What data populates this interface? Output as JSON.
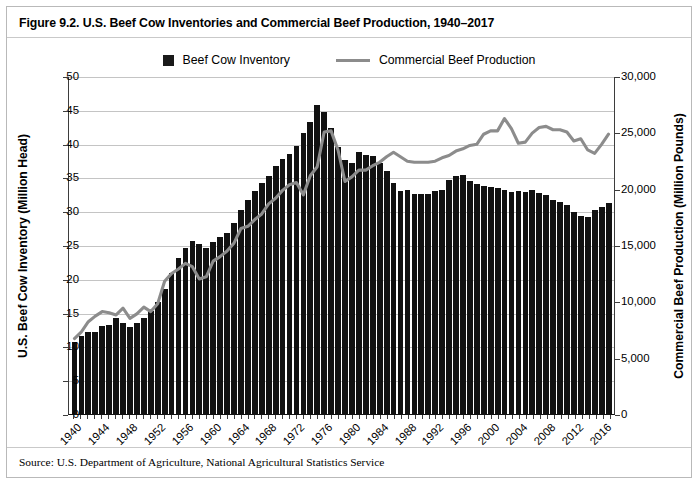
{
  "figure": {
    "title": "Figure 9.2. U.S. Beef Cow Inventories and Commercial Beef Production, 1940–2017",
    "source": "Source: U.S. Department of Agriculture, National Agricultural Statistics Service"
  },
  "legend": {
    "items": [
      {
        "label": "Beef Cow Inventory",
        "marker": "square",
        "color": "#1a1a1a"
      },
      {
        "label": "Commercial Beef Production",
        "marker": "line",
        "color": "#8c8c8c"
      }
    ]
  },
  "colors": {
    "bar": "#111111",
    "line": "#8c8c8c",
    "grid": "#c4c4c4",
    "axis": "#3d3d3d",
    "border": "#b9b9b9",
    "background": "#ffffff"
  },
  "chart_data": {
    "type": "bar",
    "title": "Figure 9.2. U.S. Beef Cow Inventories and Commercial Beef Production, 1940–2017",
    "xlabel": "",
    "ylabel": "U.S. Beef Cow Inventory (Million Head)",
    "y2label": "Commercial Beef Production (Million Pounds)",
    "ylim": [
      0,
      50
    ],
    "y2lim": [
      0,
      30000
    ],
    "yticks": [
      0,
      5,
      10,
      15,
      20,
      25,
      30,
      35,
      40,
      45,
      50
    ],
    "y2ticks": [
      0,
      5000,
      10000,
      15000,
      20000,
      25000,
      30000
    ],
    "ytick_labels": [
      "0",
      "5",
      "10",
      "15",
      "20",
      "25",
      "30",
      "35",
      "40",
      "45",
      "50"
    ],
    "y2tick_labels": [
      "0",
      "5,000",
      "10,000",
      "15,000",
      "20,000",
      "25,000",
      "30,000"
    ],
    "grid": true,
    "legend_position": "top-center",
    "xtick_labels": [
      "1940",
      "1944",
      "1948",
      "1952",
      "1956",
      "1960",
      "1964",
      "1968",
      "1972",
      "1976",
      "1980",
      "1984",
      "1988",
      "1992",
      "1996",
      "2000",
      "2004",
      "2008",
      "2012",
      "2016"
    ],
    "x": [
      1940,
      1941,
      1942,
      1943,
      1944,
      1945,
      1946,
      1947,
      1948,
      1949,
      1950,
      1951,
      1952,
      1953,
      1954,
      1955,
      1956,
      1957,
      1958,
      1959,
      1960,
      1961,
      1962,
      1963,
      1964,
      1965,
      1966,
      1967,
      1968,
      1969,
      1970,
      1971,
      1972,
      1973,
      1974,
      1975,
      1976,
      1977,
      1978,
      1979,
      1980,
      1981,
      1982,
      1983,
      1984,
      1985,
      1986,
      1987,
      1988,
      1989,
      1990,
      1991,
      1992,
      1993,
      1994,
      1995,
      1996,
      1997,
      1998,
      1999,
      2000,
      2001,
      2002,
      2003,
      2004,
      2005,
      2006,
      2007,
      2008,
      2009,
      2010,
      2011,
      2012,
      2013,
      2014,
      2015,
      2016,
      2017
    ],
    "series": [
      {
        "name": "Beef Cow Inventory",
        "axis": "left",
        "units": "Million Head",
        "type": "bar",
        "values": [
          10.7,
          11.5,
          12.1,
          12.2,
          13.0,
          13.2,
          14.2,
          13.4,
          12.9,
          13.4,
          14.2,
          15.2,
          16.5,
          18.5,
          20.9,
          23.1,
          24.6,
          25.6,
          25.1,
          24.5,
          25.5,
          26.2,
          26.8,
          28.2,
          30.2,
          31.7,
          33.0,
          34.2,
          35.2,
          36.7,
          37.7,
          38.4,
          39.6,
          41.5,
          43.2,
          45.7,
          44.7,
          42.3,
          39.5,
          37.6,
          37.1,
          38.8,
          38.3,
          38.1,
          37.2,
          36.0,
          34.2,
          33.0,
          33.1,
          32.5,
          32.5,
          32.6,
          33.0,
          33.2,
          34.6,
          35.2,
          35.3,
          34.4,
          34.0,
          33.7,
          33.6,
          33.4,
          33.1,
          32.9,
          33.0,
          32.9,
          33.2,
          32.7,
          32.4,
          31.7,
          31.4,
          30.9,
          29.9,
          29.3,
          29.1,
          30.2,
          30.6,
          31.2
        ]
      },
      {
        "name": "Commercial Beef Production",
        "axis": "right",
        "units": "Million Pounds",
        "type": "line",
        "values": [
          6700,
          7300,
          8200,
          8700,
          9100,
          9000,
          8800,
          9400,
          8500,
          8900,
          9500,
          9100,
          9800,
          11800,
          12500,
          12900,
          13400,
          13100,
          12000,
          12200,
          13600,
          14000,
          14500,
          15200,
          16500,
          16700,
          17300,
          17800,
          18700,
          19200,
          19900,
          20400,
          20600,
          19500,
          21200,
          22000,
          25100,
          25200,
          23500,
          20700,
          21100,
          21700,
          21700,
          22100,
          22400,
          22900,
          23300,
          22900,
          22500,
          22400,
          22400,
          22400,
          22500,
          22800,
          23000,
          23400,
          23600,
          23900,
          24000,
          24900,
          25200,
          25200,
          26300,
          25400,
          24100,
          24200,
          25000,
          25500,
          25600,
          25300,
          25300,
          25100,
          24300,
          24500,
          23500,
          23200,
          24000,
          24900
        ]
      }
    ]
  }
}
